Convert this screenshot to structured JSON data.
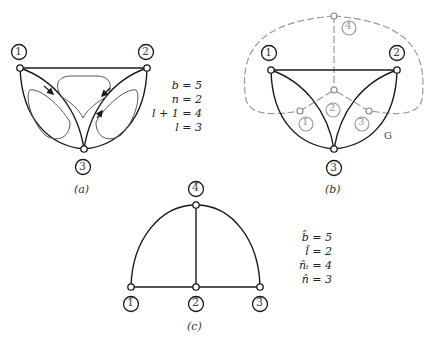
{
  "figure": {
    "panels": [
      {
        "id": "a",
        "caption": "(a)",
        "node_labels": [
          "1",
          "2",
          "3"
        ],
        "equations": [
          "b = 5",
          "n = 2",
          "l + 1 = 4",
          "l = 3"
        ]
      },
      {
        "id": "b",
        "caption": "(b)",
        "node_labels": [
          "1",
          "2",
          "3"
        ],
        "dual_node_labels": [
          "1̂",
          "2̂",
          "3̂",
          "4̂"
        ],
        "graph_label": "G"
      },
      {
        "id": "c",
        "caption": "(c)",
        "node_labels": [
          "1̂",
          "2̂",
          "3̂",
          "4̂"
        ],
        "equations": [
          "b̂ = 5",
          "l̂ = 2",
          "n̂ₜ = 4",
          "n̂ = 3"
        ]
      }
    ],
    "colors": {
      "graph_edge": "#1a1a1a",
      "dual_edge": "#9a9a9a",
      "mesh_arrow": "#555555"
    }
  }
}
